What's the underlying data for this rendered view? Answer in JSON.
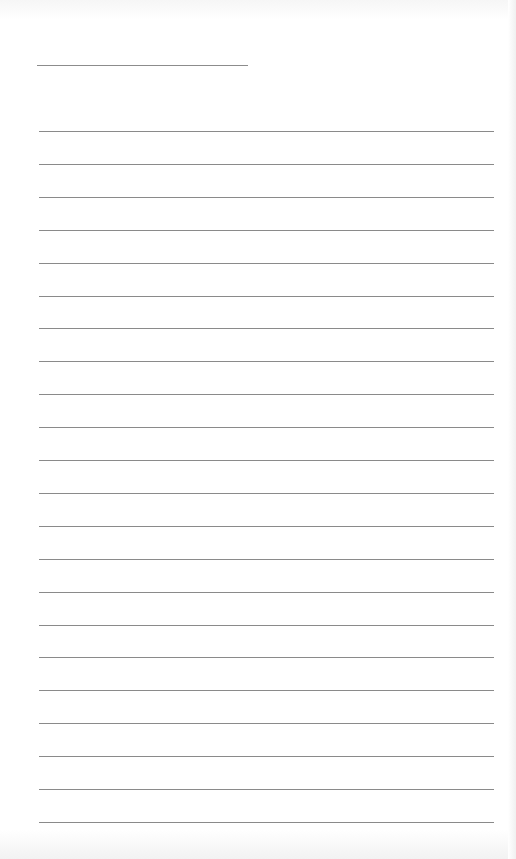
{
  "document": {
    "type": "lined-paper",
    "title_line": {
      "text": "",
      "x": 37,
      "y": 65,
      "width": 211
    },
    "rules": {
      "count": 22,
      "first_y": 131,
      "spacing": 32.9,
      "x": 39,
      "width": 455,
      "color": "#8a8a8a"
    }
  }
}
